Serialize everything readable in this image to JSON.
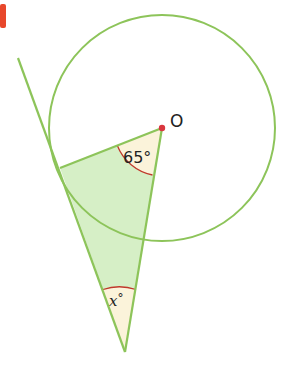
{
  "figure": {
    "marker_color": "#e8472b",
    "line_color": "#8dc45a",
    "fill_color": "#d6efc6",
    "angle_fill_color": "#fbf3da",
    "arc_color": "#c0392b",
    "center_label": "O",
    "center_angle_label": "65°",
    "tangent_angle_label_var": "x",
    "tangent_angle_label_deg": "°",
    "center": {
      "x": 162,
      "y": 128
    },
    "radius": 113,
    "tangent_point": {
      "x": 60,
      "y": 168
    },
    "apex": {
      "x": 125,
      "y": 352
    },
    "tangent_line_start": {
      "x": 18,
      "y": 58
    }
  }
}
